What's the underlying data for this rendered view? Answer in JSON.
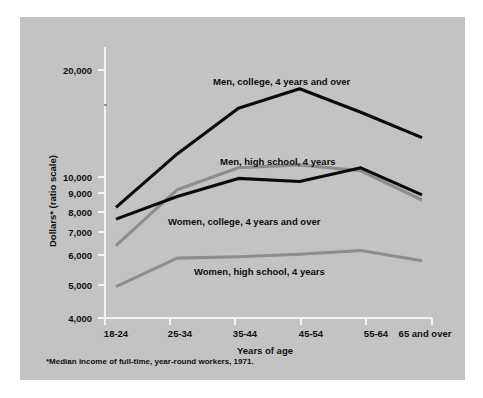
{
  "figure": {
    "background_color": "#c3c3c3",
    "page_background": "#ffffff"
  },
  "footnote": "*Median income of full-time, year-round workers, 1971.",
  "axis": {
    "ylabel": "Dollars* (ratio scale)",
    "xlabel": "Years of age"
  },
  "chart_data": {
    "type": "line",
    "title": "",
    "xlabel": "Years of age",
    "ylabel": "Dollars* (ratio scale)",
    "yscale": "log",
    "ylim": [
      4000,
      22000
    ],
    "grid": false,
    "legend": "inline-labels",
    "ytick_labels": [
      "20,000",
      "10,000",
      "9,000",
      "8,000",
      "7,000",
      "6,000",
      "5,000",
      "4,000"
    ],
    "ytick_values": [
      20000,
      10000,
      9000,
      8000,
      7000,
      6000,
      5000,
      4000
    ],
    "categories": [
      "18-24",
      "25-34",
      "35-44",
      "45-54",
      "55-64",
      "65 and over"
    ],
    "series": [
      {
        "name": "Men, college, 4 years and over",
        "color": "#0b0b0b",
        "values": [
          8200,
          11600,
          15600,
          17700,
          15200,
          12900
        ]
      },
      {
        "name": "Men, high school, 4 years",
        "color": "#8d8d8d",
        "values": [
          6400,
          9200,
          10600,
          10800,
          10400,
          8600
        ]
      },
      {
        "name": "Women, college, 4 years and over",
        "color": "#0b0b0b",
        "values": [
          7600,
          8800,
          9900,
          9700,
          10600,
          8900
        ]
      },
      {
        "name": "Women, high school, 4 years",
        "color": "#8d8d8d",
        "values": [
          4900,
          5900,
          5950,
          6050,
          6200,
          5800
        ]
      }
    ],
    "annotations": [
      {
        "text": "Men, college, 4 years and over",
        "x": 0.435,
        "y": 0.1
      },
      {
        "text": "Men, high school, 4 years",
        "x": 0.435,
        "y": 0.315
      },
      {
        "text": "Women, college, 4 years and over",
        "x": 0.34,
        "y": 0.545
      },
      {
        "text": "Women, high school, 4 years",
        "x": 0.4,
        "y": 0.7
      }
    ]
  }
}
